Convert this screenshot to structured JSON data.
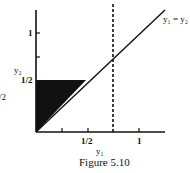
{
  "figure": {
    "caption": "Figure 5.10",
    "x_axis": {
      "label": "y₁",
      "ticks": [
        {
          "value": 0.25,
          "label": ""
        },
        {
          "value": 0.5,
          "label": "1/2"
        },
        {
          "value": 0.75,
          "label": ""
        },
        {
          "value": 1,
          "label": "1"
        }
      ]
    },
    "y_axis": {
      "label": "y₂",
      "ticks": [
        {
          "value": 0.5,
          "label": "1/2"
        },
        {
          "value": 0.75,
          "label": ""
        },
        {
          "value": 1,
          "label": "1"
        }
      ]
    },
    "line_label": "y₁ = y₂",
    "left_edge_fragment": "/2",
    "shaded_region": "triangle between y2-axis, y2 = 1/2, and y1 = y2",
    "dashed_line": {
      "x_value": 0.75,
      "style": "dashed vertical"
    },
    "colors": {
      "ink": "#111111",
      "background": "#ffffff"
    }
  }
}
